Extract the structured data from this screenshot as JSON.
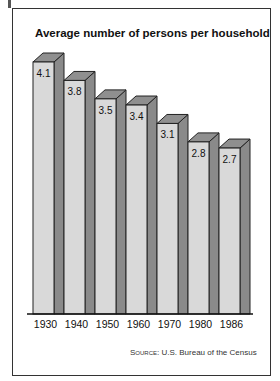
{
  "chart_data": {
    "type": "bar",
    "title": "Average number of persons per household",
    "categories": [
      "1930",
      "1940",
      "1950",
      "1960",
      "1970",
      "1980",
      "1986"
    ],
    "values": [
      4.1,
      3.8,
      3.5,
      3.4,
      3.1,
      2.8,
      2.7
    ],
    "xlabel": "",
    "ylabel": "",
    "source_label": "Source:",
    "source_text": "U.S. Bureau of the Census",
    "style": "3d-bars",
    "colors": {
      "front": "#d9d9d9",
      "side": "#8a8a8a",
      "top": "#8f8f8f",
      "outline": "#222222"
    }
  }
}
